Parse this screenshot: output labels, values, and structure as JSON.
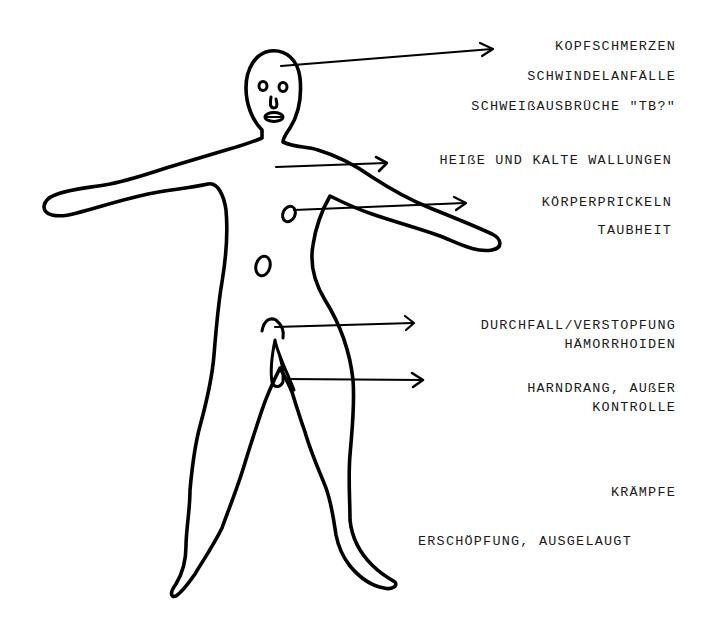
{
  "diagram": {
    "type": "annotated-body-figure",
    "stroke_color": "#000000",
    "background": "#ffffff",
    "labels": [
      {
        "id": "kopfschmerzen",
        "text": "KOPFSCHMERZEN"
      },
      {
        "id": "schwindelanfaelle",
        "text": "SCHWINDELANFÄLLE"
      },
      {
        "id": "schweissausbrueche",
        "text": "SCHWEIßAUSBRÜCHE \"TB?\""
      },
      {
        "id": "wallungen",
        "text": "HEIßE UND KALTE WALLUNGEN"
      },
      {
        "id": "koerperprickeln",
        "text": "KÖRPERPRICKELN"
      },
      {
        "id": "taubheit",
        "text": "TAUBHEIT"
      },
      {
        "id": "durchfall",
        "text": "DURCHFALL/VERSTOPFUNG"
      },
      {
        "id": "haemorrhoiden",
        "text": "HÄMORRHOIDEN"
      },
      {
        "id": "harndrang",
        "text": "HARNDRANG, AUßER"
      },
      {
        "id": "kontrolle",
        "text": "KONTROLLE"
      },
      {
        "id": "kraempfe",
        "text": "KRÄMPFE"
      },
      {
        "id": "erschoepfung",
        "text": "ERSCHÖPFUNG, AUSGELAUGT"
      }
    ],
    "arrows": [
      {
        "name": "head-arrow",
        "from": "head",
        "to": "kopfschmerzen"
      },
      {
        "name": "chest-arrow",
        "from": "chest",
        "to": "wallungen"
      },
      {
        "name": "stomach-arrow",
        "from": "stomach",
        "to": "koerperprickeln"
      },
      {
        "name": "bowel-arrow",
        "from": "bowel",
        "to": "durchfall"
      },
      {
        "name": "bladder-arrow",
        "from": "genitals",
        "to": "harndrang"
      }
    ]
  }
}
